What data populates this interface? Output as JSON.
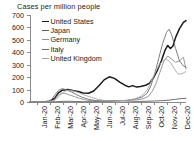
{
  "chart_data": {
    "type": "line",
    "title": "Cases per million people",
    "xlabel": "",
    "ylabel": "",
    "ylim": [
      0,
      700
    ],
    "yticks": [
      0,
      100,
      200,
      300,
      400,
      500,
      600,
      700
    ],
    "grid": false,
    "legend_position": "upper-left-inside",
    "categories": [
      "Jan-20",
      "Feb-20",
      "Mar-20",
      "Apr-20",
      "May-20",
      "Jun-20",
      "Jul-20",
      "Aug-20",
      "Sep-20",
      "Oct-20",
      "Nov-20",
      "Dec-20"
    ],
    "x": [
      0,
      1,
      2,
      3,
      4,
      5,
      6,
      7,
      8,
      9,
      10,
      11
    ],
    "series": [
      {
        "name": "United States",
        "color": "#1a1a1a",
        "width": 1.5,
        "values": [
          0,
          1,
          20,
          95,
          90,
          70,
          200,
          150,
          120,
          150,
          430,
          650
        ],
        "points": [
          [
            0.0,
            0
          ],
          [
            0.4,
            0
          ],
          [
            1.0,
            1
          ],
          [
            1.5,
            6
          ],
          [
            1.9,
            30
          ],
          [
            2.2,
            75
          ],
          [
            2.5,
            95
          ],
          [
            2.9,
            100
          ],
          [
            3.3,
            92
          ],
          [
            3.7,
            85
          ],
          [
            4.1,
            72
          ],
          [
            4.5,
            70
          ],
          [
            4.9,
            88
          ],
          [
            5.3,
            130
          ],
          [
            5.7,
            178
          ],
          [
            6.1,
            203
          ],
          [
            6.5,
            190
          ],
          [
            6.9,
            160
          ],
          [
            7.3,
            135
          ],
          [
            7.6,
            122
          ],
          [
            7.9,
            132
          ],
          [
            8.2,
            120
          ],
          [
            8.5,
            125
          ],
          [
            8.9,
            135
          ],
          [
            9.2,
            152
          ],
          [
            9.5,
            195
          ],
          [
            9.8,
            255
          ],
          [
            10.1,
            330
          ],
          [
            10.4,
            420
          ],
          [
            10.6,
            455
          ],
          [
            10.8,
            430
          ],
          [
            11.0,
            450
          ],
          [
            11.2,
            520
          ],
          [
            11.5,
            590
          ],
          [
            11.8,
            640
          ],
          [
            12.0,
            655
          ]
        ]
      },
      {
        "name": "Japan",
        "color": "#5e5e5e",
        "width": 0.9,
        "values": [
          0,
          0,
          2,
          6,
          3,
          2,
          10,
          12,
          5,
          6,
          12,
          28
        ],
        "points": [
          [
            0.0,
            0
          ],
          [
            1.0,
            0
          ],
          [
            2.0,
            2
          ],
          [
            2.6,
            5
          ],
          [
            3.0,
            6
          ],
          [
            3.6,
            4
          ],
          [
            4.2,
            2
          ],
          [
            5.0,
            3
          ],
          [
            5.6,
            8
          ],
          [
            6.1,
            12
          ],
          [
            6.6,
            11
          ],
          [
            7.2,
            9
          ],
          [
            7.8,
            6
          ],
          [
            8.4,
            5
          ],
          [
            9.0,
            6
          ],
          [
            9.6,
            8
          ],
          [
            10.2,
            11
          ],
          [
            10.7,
            15
          ],
          [
            11.2,
            22
          ],
          [
            11.6,
            27
          ],
          [
            12.0,
            30
          ]
        ]
      },
      {
        "name": "Germany",
        "color": "#8f8f8f",
        "width": 0.9,
        "values": [
          0,
          1,
          60,
          50,
          15,
          5,
          6,
          12,
          20,
          90,
          380,
          340
        ],
        "points": [
          [
            0.0,
            0
          ],
          [
            1.2,
            0
          ],
          [
            1.8,
            10
          ],
          [
            2.1,
            48
          ],
          [
            2.4,
            72
          ],
          [
            2.7,
            70
          ],
          [
            3.0,
            58
          ],
          [
            3.4,
            44
          ],
          [
            3.8,
            30
          ],
          [
            4.2,
            18
          ],
          [
            4.7,
            10
          ],
          [
            5.2,
            6
          ],
          [
            5.8,
            5
          ],
          [
            6.4,
            7
          ],
          [
            7.0,
            11
          ],
          [
            7.6,
            14
          ],
          [
            8.2,
            18
          ],
          [
            8.7,
            26
          ],
          [
            9.1,
            45
          ],
          [
            9.4,
            85
          ],
          [
            9.7,
            150
          ],
          [
            10.0,
            240
          ],
          [
            10.3,
            330
          ],
          [
            10.6,
            370
          ],
          [
            10.9,
            345
          ],
          [
            11.2,
            320
          ],
          [
            11.5,
            330
          ],
          [
            11.8,
            360
          ],
          [
            12.0,
            265
          ]
        ]
      },
      {
        "name": "Italy",
        "color": "#707070",
        "width": 0.9,
        "values": [
          0,
          2,
          95,
          70,
          25,
          8,
          5,
          8,
          25,
          130,
          570,
          290
        ],
        "points": [
          [
            0.0,
            0
          ],
          [
            1.1,
            0
          ],
          [
            1.6,
            12
          ],
          [
            1.9,
            55
          ],
          [
            2.2,
            95
          ],
          [
            2.5,
            108
          ],
          [
            2.8,
            98
          ],
          [
            3.2,
            80
          ],
          [
            3.6,
            58
          ],
          [
            4.0,
            38
          ],
          [
            4.5,
            22
          ],
          [
            5.0,
            12
          ],
          [
            5.6,
            7
          ],
          [
            6.2,
            6
          ],
          [
            6.8,
            9
          ],
          [
            7.4,
            12
          ],
          [
            8.0,
            22
          ],
          [
            8.6,
            38
          ],
          [
            9.0,
            70
          ],
          [
            9.3,
            130
          ],
          [
            9.6,
            230
          ],
          [
            9.9,
            350
          ],
          [
            10.2,
            470
          ],
          [
            10.5,
            560
          ],
          [
            10.7,
            585
          ],
          [
            10.9,
            540
          ],
          [
            11.2,
            430
          ],
          [
            11.5,
            330
          ],
          [
            11.8,
            290
          ],
          [
            12.0,
            280
          ]
        ]
      },
      {
        "name": "United Kingdom",
        "color": "#a8a8a8",
        "width": 0.9,
        "values": [
          0,
          0,
          45,
          85,
          50,
          18,
          8,
          10,
          30,
          190,
          330,
          250
        ],
        "points": [
          [
            0.0,
            0
          ],
          [
            1.3,
            0
          ],
          [
            1.9,
            14
          ],
          [
            2.3,
            52
          ],
          [
            2.7,
            88
          ],
          [
            3.0,
            95
          ],
          [
            3.4,
            88
          ],
          [
            3.8,
            72
          ],
          [
            4.2,
            55
          ],
          [
            4.7,
            38
          ],
          [
            5.2,
            22
          ],
          [
            5.7,
            13
          ],
          [
            6.3,
            9
          ],
          [
            6.9,
            10
          ],
          [
            7.5,
            14
          ],
          [
            8.1,
            26
          ],
          [
            8.6,
            50
          ],
          [
            9.0,
            95
          ],
          [
            9.3,
            160
          ],
          [
            9.6,
            230
          ],
          [
            9.9,
            290
          ],
          [
            10.2,
            330
          ],
          [
            10.5,
            345
          ],
          [
            10.8,
            320
          ],
          [
            11.1,
            265
          ],
          [
            11.4,
            225
          ],
          [
            11.7,
            228
          ],
          [
            12.0,
            245
          ]
        ]
      }
    ]
  }
}
